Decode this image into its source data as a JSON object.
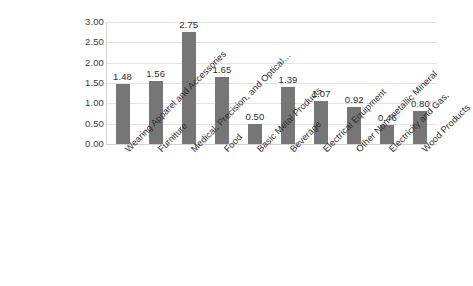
{
  "chart_data": {
    "type": "bar",
    "title": "",
    "subtitle": "",
    "xlabel": "",
    "ylabel": "",
    "ylim": [
      0,
      3.0
    ],
    "ytick_step": 0.5,
    "grid": true,
    "legend": false,
    "legend_position": "none",
    "bar_color": "#767676",
    "gridline_color": "#e3e3e3",
    "label_rotation": -45,
    "value_label_format": "0.00",
    "categories": [
      "Wearing Apparel and Accessories",
      "Furniture",
      "Medical, Precision, and Optical…",
      "Food",
      "Basic Metal Products",
      "Beverage",
      "Electrical Equipment",
      "Other Non-metallic Mineral",
      "Electricity and Gas,",
      "Wood Products"
    ],
    "values": [
      1.48,
      1.56,
      2.75,
      1.65,
      0.5,
      1.39,
      1.07,
      0.92,
      0.46,
      0.8
    ],
    "value_labels": [
      "1.48",
      "1.56",
      "2.75",
      "1.65",
      "0.50",
      "1.39",
      "1.07",
      "0.92",
      "0.46",
      "0.80"
    ],
    "ytick_labels": [
      "3.00",
      "2.50",
      "2.00",
      "1.50",
      "1.00",
      "0.50",
      "0.00"
    ],
    "ytick_values": [
      3.0,
      2.5,
      2.0,
      1.5,
      1.0,
      0.5,
      0.0
    ]
  }
}
